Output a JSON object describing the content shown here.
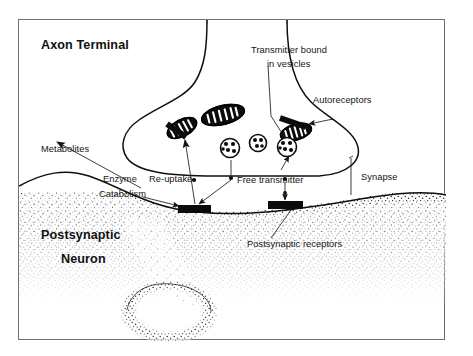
{
  "figure": {
    "frame_color": "#6e6e76",
    "ink_color": "#111111",
    "background": "#ffffff"
  },
  "labels": {
    "axon_terminal": "Axon Terminal",
    "postsynaptic_neuron_line1": "Postsynaptic",
    "postsynaptic_neuron_line2": "Neuron",
    "transmitter_bound_line1": "Transmitter bound",
    "transmitter_bound_line2": "in vesicles",
    "autoreceptors": "Autoreceptors",
    "metabolites": "Metabolites",
    "enzyme": "Enzyme",
    "catabolism": "Catabolism",
    "reuptake": "Re-uptake",
    "free_transmitter": "Free transmitter",
    "synapse": "Synapse",
    "postsynaptic_receptors": "Postsynaptic receptors"
  },
  "structures": {
    "mitochondria": [
      {
        "cx": 163,
        "cy": 108,
        "rx": 16,
        "ry": 8.5,
        "rot": -28
      },
      {
        "cx": 204,
        "cy": 95,
        "rx": 22,
        "ry": 9.5,
        "rot": -14
      },
      {
        "cx": 277,
        "cy": 112,
        "rx": 16,
        "ry": 8,
        "rot": -16
      }
    ],
    "vesicles": [
      {
        "cx": 211,
        "cy": 128,
        "r": 9.5
      },
      {
        "cx": 239,
        "cy": 123,
        "r": 8.5
      },
      {
        "cx": 268,
        "cy": 127,
        "r": 9.5
      }
    ],
    "autoreceptor_bands": [
      {
        "x1": 148,
        "y1": 104,
        "x2": 166,
        "y2": 116,
        "w": 5.5
      },
      {
        "x1": 262,
        "y1": 99,
        "x2": 286,
        "y2": 107,
        "w": 5.5
      }
    ],
    "postsynaptic_receptors": [
      {
        "x": 160,
        "y": 190,
        "w": 32,
        "h": 8
      },
      {
        "x": 250,
        "y": 186,
        "w": 34,
        "h": 8
      }
    ],
    "free_transmitter_dots": [
      {
        "cx": 214,
        "cy": 158,
        "r": 2.0
      },
      {
        "cx": 231,
        "cy": 164,
        "r": 2.0
      },
      {
        "cx": 265,
        "cy": 158,
        "r": 2.0
      },
      {
        "cx": 266,
        "cy": 176,
        "r": 1.7
      }
    ],
    "nucleus": {
      "cx": 150,
      "cy": 292,
      "rx": 42,
      "ry": 25
    }
  }
}
